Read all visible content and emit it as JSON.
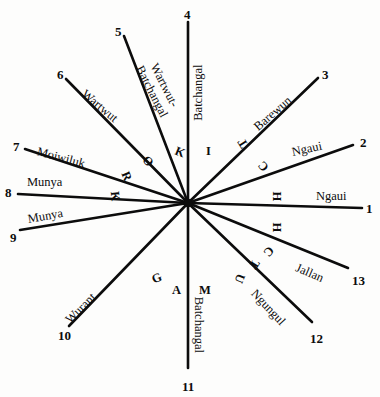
{
  "figure": {
    "center": {
      "x": 188,
      "y": 203
    },
    "ink_color": "#0c0c0c",
    "background_color": "#fdfdfc"
  },
  "rays": [
    {
      "number": "1",
      "label": "Ngaui",
      "num_x": 366,
      "num_y": 202,
      "end_x": 362,
      "end_y": 208,
      "label_x": 316,
      "label_y": 190,
      "label_rot": 0
    },
    {
      "number": "2",
      "label": "Ngaui",
      "num_x": 360,
      "num_y": 136,
      "end_x": 353,
      "end_y": 145,
      "label_x": 292,
      "label_y": 146,
      "label_rot": -12
    },
    {
      "number": "3",
      "label": "Barewun",
      "num_x": 322,
      "num_y": 68,
      "end_x": 318,
      "end_y": 78,
      "label_x": 256,
      "label_y": 122,
      "label_rot": -41
    },
    {
      "number": "4",
      "label": "Batchangal",
      "num_x": 184,
      "num_y": 8,
      "end_x": 188,
      "end_y": 22,
      "label_x": 199,
      "label_y": 114,
      "label_rot": -90
    },
    {
      "number": "5",
      "label": "Wartwut-\nBatchangal",
      "num_x": 115,
      "num_y": 25,
      "end_x": 124,
      "end_y": 36,
      "label_x": 145,
      "label_y": 50,
      "label_rot": 63
    },
    {
      "number": "6",
      "label": "Wartwut",
      "num_x": 57,
      "num_y": 68,
      "end_x": 66,
      "end_y": 79,
      "label_x": 83,
      "label_y": 86,
      "label_rot": 40
    },
    {
      "number": "7",
      "label": "Moiwiluk",
      "num_x": 13,
      "num_y": 140,
      "end_x": 25,
      "end_y": 149,
      "label_x": 37,
      "label_y": 145,
      "label_rot": 15
    },
    {
      "number": "8",
      "label": "Munya",
      "num_x": 5,
      "num_y": 186,
      "end_x": 18,
      "end_y": 194,
      "label_x": 27,
      "label_y": 176,
      "label_rot": 0
    },
    {
      "number": "9",
      "label": "Munya",
      "num_x": 10,
      "num_y": 231,
      "end_x": 20,
      "end_y": 230,
      "label_x": 28,
      "label_y": 213,
      "label_rot": -10
    },
    {
      "number": "10",
      "label": "Wurant",
      "num_x": 58,
      "num_y": 329,
      "end_x": 69,
      "end_y": 326,
      "label_x": 68,
      "label_y": 315,
      "label_rot": -45
    },
    {
      "number": "11",
      "label": "Batchangal",
      "num_x": 182,
      "num_y": 380,
      "end_x": 188,
      "end_y": 368,
      "label_x": 198,
      "label_y": 290,
      "label_rot": 90
    },
    {
      "number": "12",
      "label": "Ngungul",
      "num_x": 310,
      "num_y": 332,
      "end_x": 312,
      "end_y": 322,
      "label_x": 253,
      "label_y": 285,
      "label_rot": 47
    },
    {
      "number": "13",
      "label": "Jallan",
      "num_x": 352,
      "num_y": 274,
      "end_x": 348,
      "end_y": 268,
      "label_x": 296,
      "label_y": 261,
      "label_rot": 23
    }
  ],
  "ring_letters": [
    {
      "char": "I",
      "x": 206,
      "y": 145,
      "rot": 0
    },
    {
      "char": "K",
      "x": 175,
      "y": 146,
      "rot": 22
    },
    {
      "char": "O",
      "x": 143,
      "y": 155,
      "rot": 48
    },
    {
      "char": "R",
      "x": 122,
      "y": 170,
      "rot": 68
    },
    {
      "char": "K",
      "x": 110,
      "y": 190,
      "rot": 84
    },
    {
      "char": "G",
      "x": 152,
      "y": 272,
      "rot": -22
    },
    {
      "char": "A",
      "x": 172,
      "y": 284,
      "rot": 0
    },
    {
      "char": "M",
      "x": 199,
      "y": 284,
      "rot": 0
    },
    {
      "char": "U",
      "x": 235,
      "y": 272,
      "rot": 112
    },
    {
      "char": "T",
      "x": 250,
      "y": 258,
      "rot": 122
    },
    {
      "char": "C",
      "x": 264,
      "y": 245,
      "rot": 132
    },
    {
      "char": "H",
      "x": 272,
      "y": 221,
      "rot": 90
    },
    {
      "char": "H",
      "x": 272,
      "y": 190,
      "rot": 90
    },
    {
      "char": "C",
      "x": 259,
      "y": 160,
      "rot": -130
    },
    {
      "char": "T",
      "x": 239,
      "y": 137,
      "rot": -122
    }
  ]
}
